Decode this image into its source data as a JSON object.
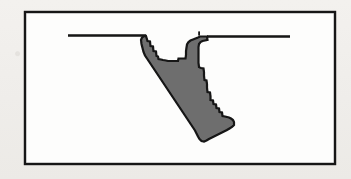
{
  "figure": {
    "kind": "scanned-line-drawing",
    "caption": "",
    "title": "",
    "background_color": "#f1efec",
    "panel_color": "#fdfdfc",
    "border_color": "#121212",
    "ink_color": "#141414",
    "fill_color": "#6e6e6e",
    "panel": {
      "x": 25,
      "y": 12,
      "width": 310,
      "height": 152,
      "border_width": 2.4
    },
    "ground_lines": [
      {
        "name": "left-ground-line",
        "x1": 68,
        "y1": 35.5,
        "x2": 146,
        "y2": 35.5,
        "stroke_width": 2.4
      },
      {
        "name": "right-ground-line",
        "x1": 207,
        "y1": 36.5,
        "x2": 290,
        "y2": 36.5,
        "stroke_width": 2.4
      }
    ],
    "speck": {
      "name": "scan-speck",
      "x": 198.2,
      "y": 31.4,
      "width": 1.8,
      "height": 4.2
    },
    "shape": {
      "name": "valley-cross-section",
      "fill": "#6e6e6e",
      "stroke": "#141414",
      "stroke_width": 2.2,
      "outline_points": "146,36 147.5,41 150,41.5 150.5,46 153,46.5 153.5,51 156,51.5 156.5,56 158,56.5 158.5,59 161,59.5 163,60 166,60.5 168,61 170,61 173,61 176,61 178,61 178.5,58.5 181,58.5 183,58.5 185.5,58.5 186,55 186,51 186.5,47.5 187,44.5 188.5,42 190.5,40.5 193,39.5 195.5,38.5 198,37.5 200,36.5 203,36.5 205,36.5 207,36.5 207.5,40 205,40.5 202.5,41 200.5,42 199,44 198.5,47 198.5,51 198.5,55 198.5,59 198.5,63 199,67 201,68 203.5,68.5 204,72 204,76 204.5,80 206.5,80.5 207,84 207,88 207.5,92 210,92.5 210.5,96 210.5,100 213,100.5 213.5,104 216,104.5 216.5,108 219,108.5 219.5,112 222,112.5 222.5,116 225,116.5 227,117 229,117.5 231,118.5 233,120 234,122 234,125 232,127 229.5,128.5 227,130 224,131.5 221,133 218,134.5 215,136 212,137.5 209,139 206.5,140.5 204,141.5 201.5,141 199.5,139 198,136.5 196.5,133.5 195,130.5 193,127.5 191,124.5 189,121.5 187,118.5 185,115.5 183,112.5 181,109.5 179,106.5 177,103.5 175,100.5 173,97.5 171,94.5 169,91.5 167,88.5 165,85.5 163,82.5 161,79.5 159,76.5 157,73.5 155,70.5 153,67.5 151,64.5 149,61.5 147,58.5 145,55.5 143.5,52 142.5,48 141.5,44 141,40 142,37.5 144,36.2 146,36"
    }
  }
}
